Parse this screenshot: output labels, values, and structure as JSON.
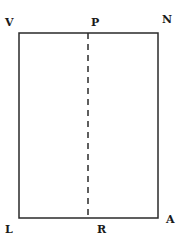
{
  "diagram": {
    "title": "",
    "rectangle": {
      "left": 19,
      "top": 33,
      "right": 158,
      "bottom": 218,
      "stroke": "#2a2a2a",
      "stroke_width": 1.5
    },
    "divider": {
      "style": "dashed",
      "x": 88,
      "y1": 33,
      "y2": 218,
      "dash": "6,5",
      "stroke": "#2a2a2a"
    },
    "vertices": [
      {
        "id": "V",
        "label": "V",
        "x": 5,
        "y": 17
      },
      {
        "id": "P",
        "label": "P",
        "x": 91,
        "y": 17
      },
      {
        "id": "N",
        "label": "N",
        "x": 162,
        "y": 14
      },
      {
        "id": "L",
        "label": "L",
        "x": 5,
        "y": 224
      },
      {
        "id": "R",
        "label": "R",
        "x": 97,
        "y": 224
      },
      {
        "id": "A",
        "label": "A",
        "x": 166,
        "y": 214
      }
    ],
    "edges": [
      {
        "from": "V",
        "to": "N",
        "style": "solid"
      },
      {
        "from": "N",
        "to": "A",
        "style": "solid"
      },
      {
        "from": "A",
        "to": "L",
        "style": "solid"
      },
      {
        "from": "L",
        "to": "V",
        "style": "solid"
      },
      {
        "from": "P",
        "to": "R",
        "style": "dashed"
      }
    ]
  }
}
